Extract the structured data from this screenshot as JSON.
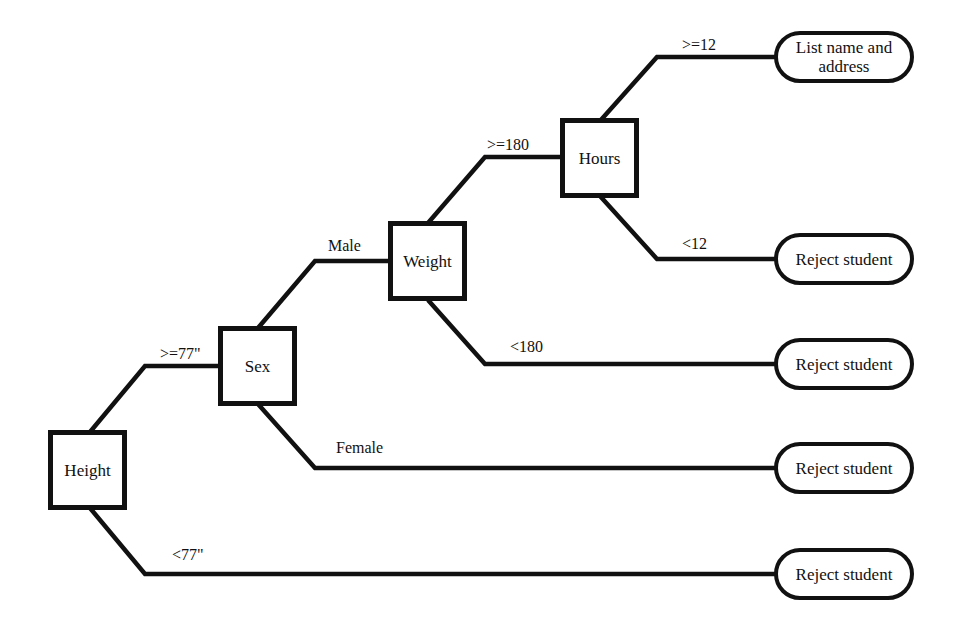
{
  "diagram": {
    "type": "decision-tree",
    "decisions": {
      "height": "Height",
      "sex": "Sex",
      "weight": "Weight",
      "hours": "Hours"
    },
    "edges": {
      "height_ge": ">=77\"",
      "height_lt": "<77\"",
      "sex_male": "Male",
      "sex_female": "Female",
      "weight_ge": ">=180",
      "weight_lt": "<180",
      "hours_ge": ">=12",
      "hours_lt": "<12"
    },
    "outcomes": {
      "list": "List name and address",
      "reject_hours": "Reject student",
      "reject_weight": "Reject student",
      "reject_female": "Reject student",
      "reject_height": "Reject student"
    },
    "colors": {
      "line": "#111111",
      "background": "#ffffff"
    }
  }
}
